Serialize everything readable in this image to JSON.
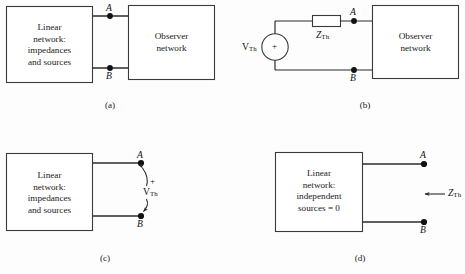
{
  "figure": {
    "stroke_color": "#3a3a3a",
    "fill_color": "#ffffff",
    "text_color": "#1a1a1a"
  },
  "panels": [
    {
      "id": "a",
      "caption": "(a)",
      "boxes": [
        {
          "name": "linear-network-box",
          "label": "Linear\nnetwork:\nimpedances\nand sources"
        },
        {
          "name": "observer-network-box",
          "label": "Observer\nnetwork"
        }
      ],
      "terminals": [
        {
          "name": "terminal-a",
          "label": "A"
        },
        {
          "name": "terminal-b",
          "label": "B"
        }
      ]
    },
    {
      "id": "b",
      "caption": "(b)",
      "boxes": [
        {
          "name": "observer-network-box",
          "label": "Observer\nnetwork"
        }
      ],
      "source": {
        "name": "voltage-source",
        "label": "V",
        "sub": "Th",
        "polarity": "+"
      },
      "impedance": {
        "name": "impedance-element",
        "label": "Z",
        "sub": "Th"
      },
      "terminals": [
        {
          "name": "terminal-a",
          "label": "A"
        },
        {
          "name": "terminal-b",
          "label": "B"
        }
      ]
    },
    {
      "id": "c",
      "caption": "(c)",
      "boxes": [
        {
          "name": "linear-network-box",
          "label": "Linear\nnetwork:\nimpedances\nand sources"
        }
      ],
      "measurement": {
        "name": "open-circuit-voltage",
        "label": "V",
        "sub": "Th",
        "polarity": "+"
      },
      "terminals": [
        {
          "name": "terminal-a",
          "label": "A"
        },
        {
          "name": "terminal-b",
          "label": "B"
        }
      ]
    },
    {
      "id": "d",
      "caption": "(d)",
      "boxes": [
        {
          "name": "linear-network-box",
          "label": "Linear\nnetwork:\nindependent\nsources = 0"
        }
      ],
      "measurement": {
        "name": "looking-in-impedance",
        "label": "Z",
        "sub": "Th"
      },
      "terminals": [
        {
          "name": "terminal-a",
          "label": "A"
        },
        {
          "name": "terminal-b",
          "label": "B"
        }
      ]
    }
  ]
}
